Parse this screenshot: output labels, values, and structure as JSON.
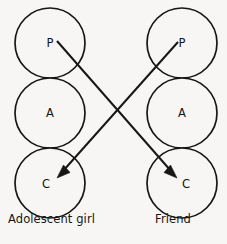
{
  "figure": {
    "type": "transactional-analysis-ego-state-diagram",
    "background_color": "#f7f6f4",
    "line_color": "#161616",
    "width": 227,
    "height": 244
  },
  "columns": [
    {
      "id": "left",
      "caption": "Adolescent girl",
      "center_x": 50,
      "states": [
        {
          "letter": "P",
          "name": "parent",
          "cx": 50,
          "cy": 43,
          "r": 35
        },
        {
          "letter": "A",
          "name": "adult",
          "cx": 50,
          "cy": 113,
          "r": 35
        },
        {
          "letter": "C",
          "name": "child",
          "cx": 50,
          "cy": 183,
          "r": 35
        }
      ]
    },
    {
      "id": "right",
      "caption": "Friend",
      "center_x": 182,
      "states": [
        {
          "letter": "P",
          "name": "parent",
          "cx": 182,
          "cy": 43,
          "r": 35
        },
        {
          "letter": "A",
          "name": "adult",
          "cx": 182,
          "cy": 113,
          "r": 35
        },
        {
          "letter": "C",
          "name": "child",
          "cx": 182,
          "cy": 183,
          "r": 35
        }
      ]
    }
  ],
  "transactions": [
    {
      "id": "left-parent-to-right-child",
      "from": "left.P",
      "to": "right.C",
      "x1": 57,
      "y1": 41,
      "x2": 177,
      "y2": 178,
      "arrowhead": "end"
    },
    {
      "id": "right-parent-to-left-child",
      "from": "right.P",
      "to": "left.C",
      "x1": 178,
      "y1": 42,
      "x2": 57,
      "y2": 178,
      "arrowhead": "end"
    }
  ]
}
